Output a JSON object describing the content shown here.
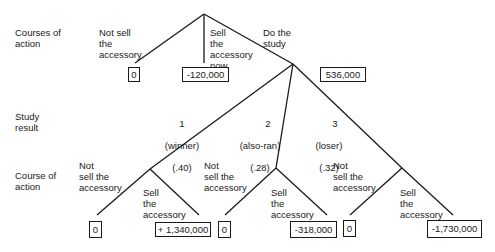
{
  "row_labels": {
    "courses_of_action": "Courses of\naction",
    "study_result": "Study\nresult",
    "course_of_action": "Course of\naction"
  },
  "first_decision": {
    "options": [
      {
        "label": "Not sell\nthe\naccessory",
        "payoff": "0"
      },
      {
        "label": "Sell\nthe\naccessory\nnow",
        "payoff": "-120,000"
      },
      {
        "label": "Do the\nstudy",
        "payoff": "536,000"
      }
    ]
  },
  "study_results": [
    {
      "number": "1",
      "name": "(winner)",
      "probability": "(.40)",
      "not_sell_label": "Not\nsell the\naccessory",
      "not_sell_payoff": "0",
      "sell_label": "Sell\nthe\naccessory",
      "sell_payoff": "+ 1,340,000"
    },
    {
      "number": "2",
      "name": "(also-ran)",
      "probability": "(.28)",
      "not_sell_label": "Not\nsell the\naccessory",
      "not_sell_payoff": "0",
      "sell_label": "Sell\nthe\naccessory",
      "sell_payoff": "-318,000"
    },
    {
      "number": "3",
      "name": "(loser)",
      "probability": "(.32)",
      "not_sell_label": "Not\nsell the\naccessory",
      "not_sell_payoff": "0",
      "sell_label": "Sell\nthe\naccessory",
      "sell_payoff": "-1,730,000"
    }
  ],
  "colors": {
    "line": "#1a1a1a",
    "background": "#ffffff"
  }
}
